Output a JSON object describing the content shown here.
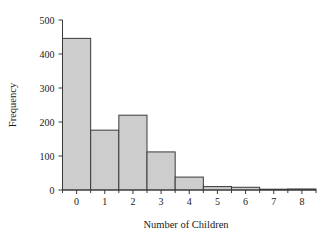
{
  "chart_data": {
    "type": "bar",
    "title": "",
    "subtitle": "",
    "xlabel": "Number of Children",
    "ylabel": "Frequency",
    "categories": [
      "0",
      "1",
      "2",
      "3",
      "4",
      "5",
      "6",
      "7",
      "8"
    ],
    "values": [
      446,
      176,
      220,
      112,
      38,
      10,
      8,
      0,
      3
    ],
    "xtick_labels": [
      "0",
      "1",
      "2",
      "3",
      "4",
      "5",
      "6",
      "7",
      "8"
    ],
    "ytick_labels": [
      "0",
      "100",
      "200",
      "300",
      "400",
      "500"
    ],
    "ytick_values": [
      0,
      100,
      200,
      300,
      400,
      500
    ],
    "ylim": [
      0,
      500
    ],
    "xlim": [
      -0.5,
      8.5
    ],
    "grid": false,
    "legend": false,
    "legend_position": "none",
    "bar_fill_color": "#cdcdcd",
    "bar_edge_color": "#3a3a3a",
    "axis_color": "#3a3a3a",
    "background_color": "#ffffff",
    "bar_width": 1.0
  }
}
